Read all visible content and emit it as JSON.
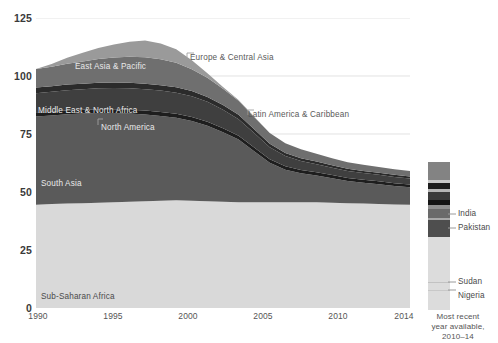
{
  "chart_data": {
    "type": "area",
    "stacking": "stacked",
    "title": "",
    "subtitle": "",
    "xlabel": "",
    "ylabel": "",
    "xlim": [
      1990,
      2014
    ],
    "ylim": [
      0,
      125
    ],
    "y_ticks": [
      0,
      25,
      50,
      75,
      100,
      125
    ],
    "x_ticks": [
      1990,
      1995,
      2000,
      2005,
      2010,
      2014
    ],
    "grid": "horizontal",
    "legend_position": "right",
    "x": [
      1990,
      1991,
      1992,
      1993,
      1994,
      1995,
      1996,
      1997,
      1998,
      1999,
      2000,
      2001,
      2002,
      2003,
      2004,
      2005,
      2006,
      2007,
      2008,
      2009,
      2010,
      2011,
      2012,
      2013,
      2014
    ],
    "series": [
      {
        "name": "Sub-Saharan Africa",
        "color": "#d9d9d9",
        "values": [
          44.5,
          44.8,
          45.0,
          45.2,
          45.4,
          45.6,
          45.8,
          46.0,
          46.2,
          46.4,
          46.2,
          46.0,
          45.8,
          45.6,
          45.6,
          45.6,
          45.6,
          45.6,
          45.6,
          45.4,
          45.2,
          45.0,
          44.8,
          44.6,
          44.5
        ]
      },
      {
        "name": "South Asia",
        "color": "#5a5a5a",
        "values": [
          38.0,
          38.2,
          38.5,
          38.6,
          38.6,
          38.4,
          38.0,
          37.4,
          36.6,
          35.6,
          34.4,
          32.6,
          30.0,
          27.0,
          22.0,
          17.0,
          14.0,
          12.5,
          11.5,
          10.5,
          9.5,
          9.0,
          8.5,
          8.0,
          7.5
        ]
      },
      {
        "name": "North America",
        "color": "#1e1e1e",
        "values": [
          1.6,
          1.6,
          1.6,
          1.6,
          1.7,
          1.7,
          1.7,
          1.7,
          1.7,
          1.7,
          1.7,
          1.7,
          1.7,
          1.6,
          1.6,
          1.5,
          1.5,
          1.4,
          1.4,
          1.4,
          1.3,
          1.3,
          1.3,
          1.2,
          1.2
        ]
      },
      {
        "name": "Middle East & North Africa",
        "color": "#3f3f3f",
        "values": [
          8.5,
          8.6,
          8.8,
          8.9,
          9.0,
          9.1,
          9.2,
          9.2,
          9.2,
          9.1,
          9.0,
          8.6,
          8.0,
          7.2,
          6.2,
          5.2,
          4.4,
          3.9,
          3.5,
          3.2,
          3.0,
          2.9,
          2.8,
          2.7,
          2.6
        ]
      },
      {
        "name": "Latin America & Caribbean",
        "color": "#2b2b2b",
        "values": [
          2.4,
          2.4,
          2.4,
          2.4,
          2.4,
          2.4,
          2.4,
          2.4,
          2.3,
          2.3,
          2.2,
          2.1,
          2.0,
          1.9,
          1.7,
          1.5,
          1.3,
          1.2,
          1.1,
          1.0,
          1.0,
          0.9,
          0.9,
          0.9,
          0.9
        ]
      },
      {
        "name": "Europe & Central Asia",
        "color": "#6f6f6f",
        "values": [
          8.0,
          8.4,
          9.0,
          9.6,
          10.2,
          10.8,
          11.2,
          11.4,
          11.2,
          10.6,
          9.4,
          8.2,
          7.0,
          6.0,
          5.2,
          4.6,
          4.2,
          3.8,
          3.4,
          3.0,
          2.8,
          2.6,
          2.5,
          2.4,
          2.3
        ]
      },
      {
        "name": "East Asia & Pacific",
        "color": "#9a9a9a",
        "values": [
          0.0,
          0.0,
          0.0,
          0.0,
          0.0,
          0.0,
          0.0,
          0.0,
          0.0,
          0.0,
          0.0,
          0.0,
          0.0,
          0.0,
          0.0,
          0.0,
          0.0,
          0.0,
          0.0,
          0.0,
          0.0,
          0.0,
          0.0,
          0.0,
          0.0
        ]
      }
    ],
    "stack_totals": [
      103.0,
      104.0,
      105.3,
      106.3,
      107.3,
      108.0,
      108.3,
      108.1,
      107.2,
      105.7,
      103.0,
      99.2,
      95.0,
      89.8,
      82.5,
      75.4,
      71.0,
      68.2,
      65.8,
      63.3,
      61.0,
      59.5,
      58.5,
      57.5,
      56.8
    ],
    "top_band_name": "East Asia & Pacific",
    "top_band_values": [
      0,
      1.2,
      2.6,
      3.7,
      4.8,
      5.6,
      6.5,
      7.2,
      6.8,
      5.8,
      3.9,
      2.0,
      0.8,
      0.4,
      0.2,
      0.0,
      0.0,
      0.0,
      0.0,
      0.0,
      0.0,
      0.0,
      0.0,
      0.0,
      0.0
    ],
    "annotations": [
      {
        "label": "East Asia & Pacific",
        "style": "light"
      },
      {
        "label": "Europe & Central Asia",
        "style": "leader"
      },
      {
        "label": "Middle East & North Africa",
        "style": "light"
      },
      {
        "label": "North America",
        "style": "leader"
      },
      {
        "label": "Latin America & Caribbean",
        "style": "leader"
      },
      {
        "label": "South Asia",
        "style": "light"
      },
      {
        "label": "Sub-Saharan Africa",
        "style": "light"
      }
    ]
  },
  "axes": {
    "y_labels": [
      "125",
      "100",
      "75",
      "50",
      "25",
      "0"
    ],
    "x_labels": [
      "1990",
      "1995",
      "2000",
      "2005",
      "2010",
      "2014"
    ]
  },
  "series_labels": {
    "east_asia_pacific": "East Asia & Pacific",
    "europe_central_asia": "Europe & Central Asia",
    "middle_east_north_africa": "Middle East & North Africa",
    "north_america": "North America",
    "latin_america_caribbean": "Latin America & Caribbean",
    "south_asia": "South Asia",
    "sub_saharan_africa": "Sub-Saharan Africa"
  },
  "legend": {
    "caption_line1": "Most recent",
    "caption_line2": "year available,",
    "caption_line3": "2010–14",
    "items": [
      {
        "label": "India",
        "color": "#6a6a6a"
      },
      {
        "label": "Pakistan",
        "color": "#4e4e4e"
      },
      {
        "label": "Sudan",
        "color": "#cfcfcf"
      },
      {
        "label": "Nigeria",
        "color": "#dcdcdc"
      }
    ]
  },
  "colors": {
    "background": "#ffffff",
    "gridline": "#d5d5d5",
    "axis_text": "#3a3a3a",
    "tick_text": "#555555",
    "sub_saharan_africa": "#d9d9d9",
    "south_asia": "#5a5a5a",
    "north_america": "#1e1e1e",
    "middle_east_north_africa": "#3f3f3f",
    "latin_america_caribbean": "#2b2b2b",
    "europe_central_asia": "#6f6f6f",
    "east_asia_pacific": "#9a9a9a"
  }
}
